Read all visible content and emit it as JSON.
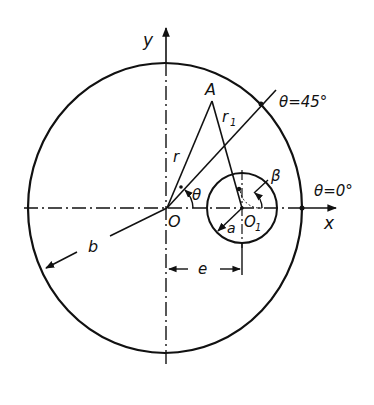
{
  "diagram": {
    "type": "geometry",
    "labels": {
      "y_axis": "y",
      "x_axis": "x",
      "point_A": "A",
      "origin": "O",
      "center_O1": "O",
      "center_O1_sub": "1",
      "r": "r",
      "r1": "r",
      "r1_sub": "1",
      "theta": "θ",
      "beta": "β",
      "a": "a",
      "b": "b",
      "e": "e",
      "theta_45": "θ=45°",
      "theta_0": "θ=0°"
    },
    "colors": {
      "ink": "#111111",
      "background": "#ffffff"
    }
  }
}
